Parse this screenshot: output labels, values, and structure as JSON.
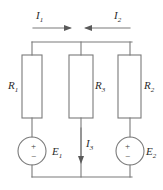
{
  "figure": {
    "name": "two-source-three-branch-parallel-circuit",
    "stroke_color": "#7a7a7a",
    "text_color": "#2b2b2b",
    "background": "#ffffff"
  },
  "currents": [
    {
      "id": "I1",
      "label": "I",
      "subscript": "1",
      "direction": "right",
      "location": "top-left-rail"
    },
    {
      "id": "I2",
      "label": "I",
      "subscript": "2",
      "direction": "left",
      "location": "top-right-rail"
    },
    {
      "id": "I3",
      "label": "I",
      "subscript": "3",
      "direction": "down",
      "location": "middle-branch"
    }
  ],
  "resistors": [
    {
      "id": "R1",
      "label": "R",
      "subscript": "1",
      "branch": "left",
      "label_side": "left"
    },
    {
      "id": "R3",
      "label": "R",
      "subscript": "3",
      "branch": "middle",
      "label_side": "right"
    },
    {
      "id": "R2",
      "label": "R",
      "subscript": "2",
      "branch": "right",
      "label_side": "right"
    }
  ],
  "sources": [
    {
      "id": "E1",
      "label": "E",
      "subscript": "1",
      "branch": "left",
      "plus": "+",
      "minus": "−",
      "polarity": "plus-on-top"
    },
    {
      "id": "E2",
      "label": "E",
      "subscript": "2",
      "branch": "right",
      "plus": "+",
      "minus": "−",
      "polarity": "plus-on-top"
    }
  ]
}
